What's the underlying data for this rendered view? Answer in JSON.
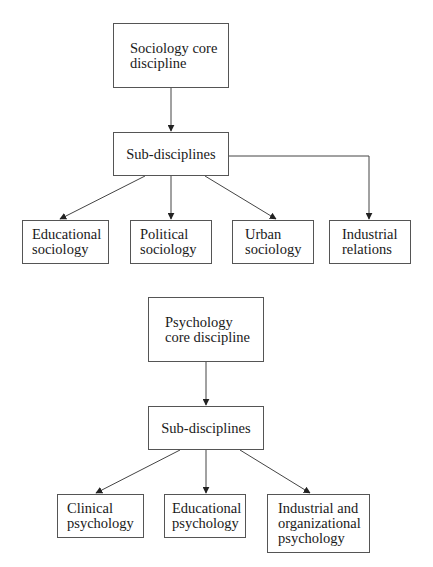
{
  "diagrams": [
    {
      "name": "sociology",
      "root": {
        "label": "Sociology core\ndiscipline"
      },
      "middle": {
        "label": "Sub-disciplines"
      },
      "children": [
        {
          "label": "Educational\nsociology"
        },
        {
          "label": "Political\nsociology"
        },
        {
          "label": "Urban\nsociology"
        },
        {
          "label": "Industrial\nrelations"
        }
      ]
    },
    {
      "name": "psychology",
      "root": {
        "label": "Psychology\ncore discipline"
      },
      "middle": {
        "label": "Sub-disciplines"
      },
      "children": [
        {
          "label": "Clinical\npsychology"
        },
        {
          "label": "Educational\npsychology"
        },
        {
          "label": "Industrial and\norganizational\npsychology"
        }
      ]
    }
  ],
  "colors": {
    "line": "#444444",
    "border": "#555555",
    "text": "#1a1a1a",
    "background": "#ffffff"
  }
}
